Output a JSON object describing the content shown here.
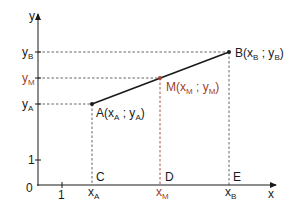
{
  "diagram": {
    "axes": {
      "x_label": "x",
      "y_label": "y",
      "origin_label": "0",
      "x_unit_label": "1",
      "y_unit_label": "1"
    },
    "y_ticks": [
      {
        "main": "y",
        "sub": "B",
        "color": "#1a1a1a"
      },
      {
        "main": "y",
        "sub": "M",
        "color": "#a0402a"
      },
      {
        "main": "y",
        "sub": "A",
        "color": "#1a1a1a"
      }
    ],
    "x_ticks": [
      {
        "main": "x",
        "sub": "A",
        "color": "#1a1a1a"
      },
      {
        "main": "x",
        "sub": "M",
        "color": "#a0402a"
      },
      {
        "main": "x",
        "sub": "B",
        "color": "#1a1a1a"
      }
    ],
    "points": {
      "A": {
        "name": "A",
        "open": "(x",
        "sub1": "A",
        "sep": " ; y",
        "sub2": "A",
        "close": ")"
      },
      "M": {
        "name": "M",
        "open": "(x",
        "sub1": "M",
        "sep": " ; y",
        "sub2": "M",
        "close": ")"
      },
      "B": {
        "name": "B",
        "open": "(x",
        "sub1": "B",
        "sep": " ; y",
        "sub2": "B",
        "close": ")"
      }
    },
    "foot_labels": {
      "C": "C",
      "D": "D",
      "E": "E"
    },
    "colors": {
      "black": "#1a1a1a",
      "accent": "#a0402a",
      "dash": "#555555"
    }
  }
}
